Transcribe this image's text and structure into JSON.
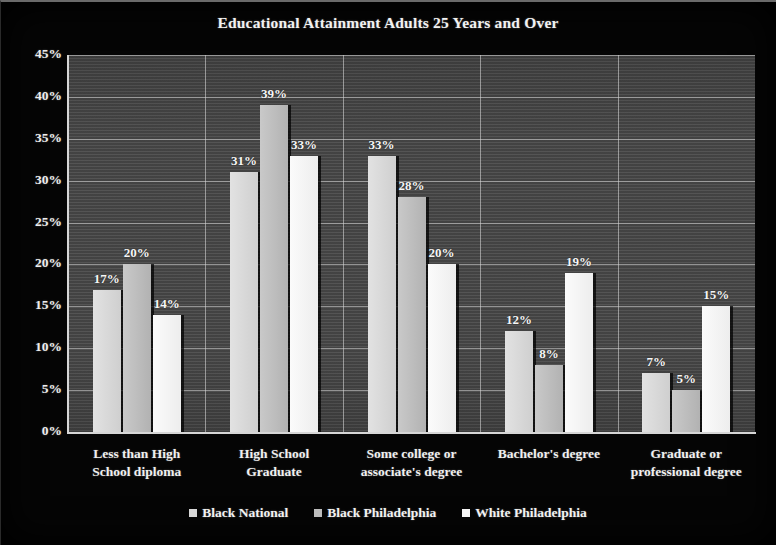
{
  "chart_data": {
    "type": "bar",
    "title": "Educational Attainment Adults 25 Years and Over",
    "xlabel": "",
    "ylabel": "",
    "ylim": [
      0,
      45
    ],
    "ytick_labels": [
      "0%",
      "5%",
      "10%",
      "15%",
      "20%",
      "25%",
      "30%",
      "35%",
      "40%",
      "45%"
    ],
    "ytick_values": [
      0,
      5,
      10,
      15,
      20,
      25,
      30,
      35,
      40,
      45
    ],
    "grid": true,
    "legend_position": "bottom",
    "categories": [
      "Less than High School diploma",
      "High School Graduate",
      "Some college or associate's degree",
      "Bachelor's degree",
      "Graduate or professional degree"
    ],
    "category_lines": [
      [
        "Less than High",
        "School diploma"
      ],
      [
        "High School",
        "Graduate"
      ],
      [
        "Some college or",
        "associate's degree"
      ],
      [
        "Bachelor's degree",
        ""
      ],
      [
        "Graduate or",
        "professional degree"
      ]
    ],
    "series": [
      {
        "name": "Black National",
        "color": "#d8d8d8",
        "values": [
          17,
          31,
          33,
          12,
          7
        ],
        "data_labels": [
          "17%",
          "31%",
          "33%",
          "12%",
          "7%"
        ]
      },
      {
        "name": "Black Philadelphia",
        "color": "#bcbcbc",
        "values": [
          20,
          39,
          28,
          8,
          5
        ],
        "data_labels": [
          "20%",
          "39%",
          "28%",
          "8%",
          "5%"
        ]
      },
      {
        "name": "White Philadelphia",
        "color": "#f4f4f4",
        "values": [
          14,
          33,
          20,
          19,
          15
        ],
        "data_labels": [
          "14%",
          "33%",
          "20%",
          "19%",
          "15%"
        ]
      }
    ]
  }
}
